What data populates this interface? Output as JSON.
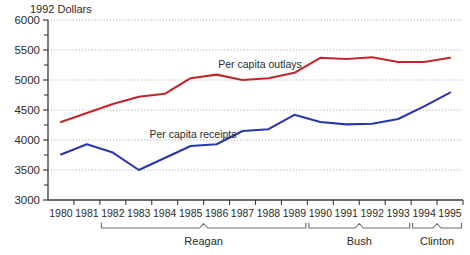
{
  "chart_data": {
    "type": "line",
    "title": "1992 Dollars",
    "xlabel": "",
    "ylabel": "1992 Dollars",
    "ylim": [
      3000,
      6000
    ],
    "ytick_step": 500,
    "yminor_step": 250,
    "grid": true,
    "legend_position": "inline-annotations",
    "categories": [
      "1980",
      "1981",
      "1982",
      "1983",
      "1984",
      "1985",
      "1986",
      "1987",
      "1988",
      "1989",
      "1990",
      "1991",
      "1992",
      "1993",
      "1994",
      "1995"
    ],
    "yticks": [
      "3000",
      "3500",
      "4000",
      "4500",
      "5000",
      "5500",
      "6000"
    ],
    "series": [
      {
        "name": "Per capita outlays",
        "color": "#c2262b",
        "values": [
          4300,
          4450,
          4600,
          4720,
          4770,
          5030,
          5090,
          5000,
          5030,
          5120,
          5370,
          5350,
          5380,
          5300,
          5300,
          5370
        ]
      },
      {
        "name": "Per capita receipts",
        "color": "#2b37a8",
        "values": [
          3760,
          3930,
          3790,
          3500,
          3700,
          3900,
          3930,
          4150,
          4180,
          4420,
          4300,
          4260,
          4270,
          4350,
          4560,
          4790
        ]
      }
    ],
    "annotations": [
      {
        "name": "outlays-label",
        "text": "Per capita outlays",
        "series": "Per capita outlays"
      },
      {
        "name": "receipts-label",
        "text": "Per capita receipts",
        "series": "Per capita receipts"
      }
    ],
    "eras": [
      {
        "label": "Reagan",
        "start": "1982",
        "end": "1989"
      },
      {
        "label": "Bush",
        "start": "1990",
        "end": "1993"
      },
      {
        "label": "Clinton",
        "start": "1994",
        "end": "1995"
      }
    ]
  },
  "colors": {
    "outlays": "#c2262b",
    "receipts": "#2b37a8",
    "axis": "#3a3a3a",
    "grid": "#9a9a9a",
    "text": "#2b2b2b",
    "background": "#ffffff"
  }
}
